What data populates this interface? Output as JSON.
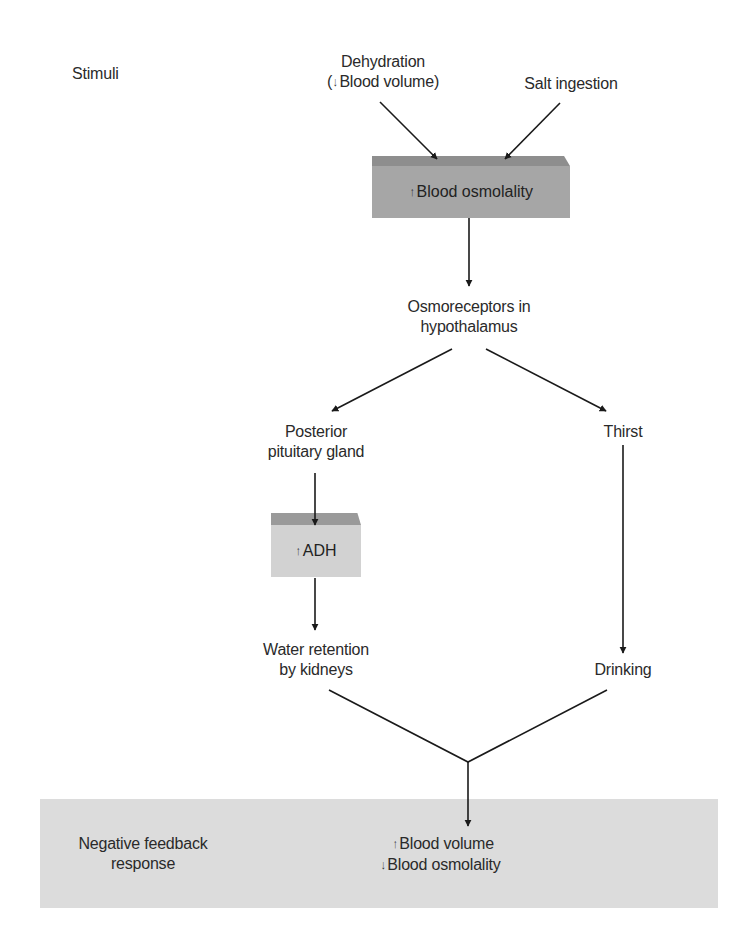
{
  "diagram": {
    "type": "flowchart",
    "topic": "Regulation of blood osmolality and volume",
    "colors": {
      "osmolality_box": "#a6a6a6",
      "osmolality_bevel": "#8e8e8e",
      "adh_box": "#d2d2d2",
      "adh_bevel": "#9a9a9a",
      "response_band": "#dcdcdc",
      "line": "#1a1a1a",
      "text": "#2a2a2a"
    }
  },
  "labels": {
    "stimuli": "Stimuli",
    "negative_feedback": {
      "line1": "Negative feedback",
      "line2": "response"
    }
  },
  "nodes": {
    "dehydration": {
      "line1": "Dehydration",
      "line2_prefix": "(",
      "line2_arrow": "↓",
      "line2_text": "Blood volume)"
    },
    "salt_ingestion": {
      "text": "Salt ingestion"
    },
    "blood_osmolality": {
      "arrow": "↑",
      "text": "Blood osmolality"
    },
    "osmoreceptors": {
      "line1": "Osmoreceptors in",
      "line2": "hypothalamus"
    },
    "posterior_pituitary": {
      "line1": "Posterior",
      "line2": "pituitary gland"
    },
    "thirst": {
      "text": "Thirst"
    },
    "adh": {
      "arrow": "↑",
      "text": "ADH"
    },
    "water_retention": {
      "line1": "Water retention",
      "line2": "by kidneys"
    },
    "drinking": {
      "text": "Drinking"
    },
    "response": {
      "line1_arrow": "↑",
      "line1_text": "Blood volume",
      "line2_arrow": "↓",
      "line2_text": "Blood osmolality"
    }
  },
  "edges": [
    {
      "from": "dehydration",
      "to": "blood_osmolality"
    },
    {
      "from": "salt_ingestion",
      "to": "blood_osmolality"
    },
    {
      "from": "blood_osmolality",
      "to": "osmoreceptors"
    },
    {
      "from": "osmoreceptors",
      "to": "posterior_pituitary"
    },
    {
      "from": "osmoreceptors",
      "to": "thirst"
    },
    {
      "from": "posterior_pituitary",
      "to": "adh"
    },
    {
      "from": "adh",
      "to": "water_retention"
    },
    {
      "from": "thirst",
      "to": "drinking"
    },
    {
      "from": "water_retention",
      "to": "response"
    },
    {
      "from": "drinking",
      "to": "response"
    }
  ]
}
